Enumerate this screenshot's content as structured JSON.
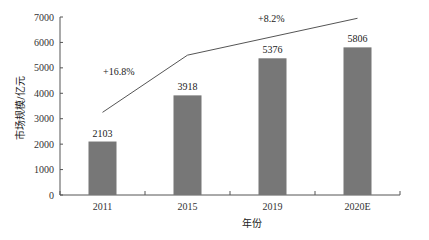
{
  "chart_data": {
    "type": "bar",
    "title": "",
    "xlabel": "年份",
    "ylabel": "市场规模/亿元",
    "categories": [
      "2011",
      "2015",
      "2019",
      "2020E"
    ],
    "values": [
      2103,
      3918,
      5376,
      5806
    ],
    "value_labels": [
      "2103",
      "3918",
      "5376",
      "5806"
    ],
    "ylim": [
      0,
      7000
    ],
    "yticks": [
      0,
      1000,
      2000,
      3000,
      4000,
      5000,
      6000,
      7000
    ],
    "ytick_labels": [
      "0",
      "1000",
      "2000",
      "3000",
      "4000",
      "5000",
      "6000",
      "7000"
    ],
    "grid": false,
    "bar_color": "#777777",
    "trend_line": {
      "description": "decorative growth trend line",
      "color": "#555555"
    },
    "annotations": [
      {
        "text": "+16.8%",
        "label": "CAGR 2011-2015"
      },
      {
        "text": "+8.2%",
        "label": "CAGR 2015-2020E"
      }
    ]
  }
}
